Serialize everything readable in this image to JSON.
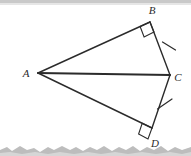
{
  "page": {
    "width": 191,
    "height": 156,
    "background_color": "#ffffff",
    "scan_artifacts": {
      "top_band_color": "#c9c9c9",
      "bottom_torn_edge_color": "#bdbdbd"
    }
  },
  "figure": {
    "type": "geometry-diagram",
    "stroke_color": "#2b2b2b",
    "points": {
      "A": {
        "x": 38,
        "y": 73,
        "label": "A",
        "label_x": 26,
        "label_y": 77
      },
      "B": {
        "x": 150,
        "y": 22,
        "label": "B",
        "label_x": 152,
        "label_y": 14
      },
      "C": {
        "x": 170,
        "y": 75,
        "label": "C",
        "label_x": 176,
        "label_y": 81
      },
      "D": {
        "x": 152,
        "y": 128,
        "label": "D",
        "label_x": 153,
        "label_y": 146
      }
    },
    "segments": [
      {
        "name": "AB",
        "from": "A",
        "to": "B",
        "width": 1.4
      },
      {
        "name": "BC",
        "from": "B",
        "to": "C",
        "width": 1.4
      },
      {
        "name": "AC",
        "from": "A",
        "to": "C",
        "width": 2.2
      },
      {
        "name": "AD",
        "from": "A",
        "to": "D",
        "width": 1.4
      },
      {
        "name": "DC",
        "from": "D",
        "to": "C",
        "width": 1.4
      }
    ],
    "right_angle_marks": [
      {
        "name": "right-angle-at-B",
        "vertex": "B",
        "size": 11
      },
      {
        "name": "right-angle-at-D",
        "vertex": "D",
        "size": 11
      }
    ],
    "congruence_ticks": [
      {
        "name": "tick-on-BC",
        "segment": "BC",
        "count": 1,
        "t": 0.46
      },
      {
        "name": "tick-on-DC",
        "segment": "DC",
        "count": 1,
        "t": 0.46
      }
    ]
  }
}
